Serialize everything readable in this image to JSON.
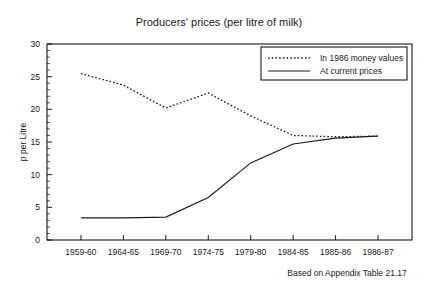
{
  "chart_data": {
    "type": "line",
    "title": "Producers' prices (per litre of milk)",
    "xlabel": "",
    "ylabel": "p per Litre",
    "caption": "Based on Appendix Table 21.17",
    "categories": [
      "1959-60",
      "1964-65",
      "1969-70",
      "1974-75",
      "1979-80",
      "1984-85",
      "1985-86",
      "1986-87"
    ],
    "series": [
      {
        "name": "In 1986 money values",
        "style": "dotted",
        "values": [
          25.5,
          23.7,
          20.2,
          22.5,
          19.0,
          16.0,
          15.8,
          15.9
        ]
      },
      {
        "name": "At current prices",
        "style": "solid",
        "values": [
          3.4,
          3.4,
          3.5,
          6.5,
          11.8,
          14.7,
          15.6,
          15.9
        ]
      }
    ],
    "ylim": [
      0,
      30
    ],
    "yticks": [
      0,
      5,
      10,
      15,
      20,
      25,
      30
    ],
    "ytick_labels": [
      "0",
      "5",
      "10",
      "15",
      "20",
      "25",
      "30"
    ],
    "y_minor_step": 1,
    "grid": false,
    "legend_position": "top-right",
    "colors": {
      "series_1": "#1a1a1a",
      "series_2": "#1a1a1a",
      "axis": "#000000",
      "background": "#ffffff"
    }
  }
}
